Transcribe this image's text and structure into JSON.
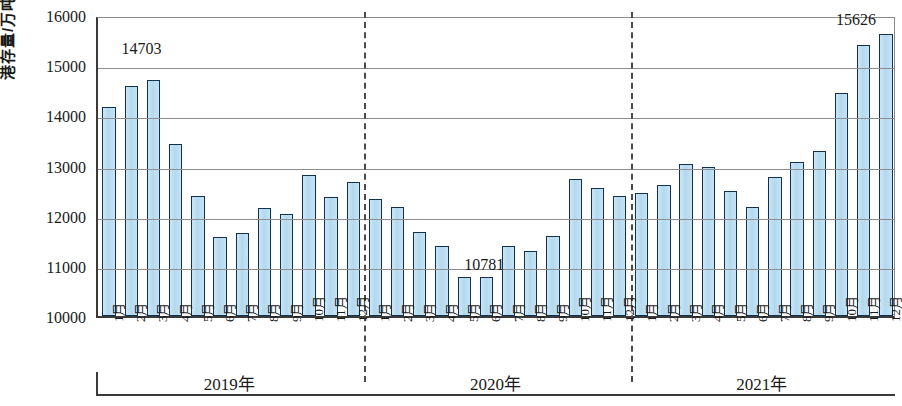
{
  "chart_data": {
    "type": "bar",
    "title": "",
    "xlabel": "",
    "ylabel": "港存量/万吨",
    "ylim": [
      10000,
      16000
    ],
    "ytick_values": [
      10000,
      11000,
      12000,
      13000,
      14000,
      15000,
      16000
    ],
    "ytick_labels": [
      "10000",
      "11000",
      "12000",
      "13000",
      "14000",
      "15000",
      "16000"
    ],
    "grid": true,
    "legend": "none",
    "groups": [
      {
        "label": "2019年",
        "categories": [
          "1月",
          "2月",
          "3月",
          "4月",
          "5月",
          "6月",
          "7月",
          "8月",
          "9月",
          "10月",
          "11月",
          "12月"
        ],
        "values": [
          14160,
          14590,
          14703,
          13430,
          12400,
          11580,
          11650,
          12150,
          12040,
          12820,
          12380,
          12670
        ]
      },
      {
        "label": "2020年",
        "categories": [
          "1月",
          "2月",
          "3月",
          "4月",
          "5月",
          "6月",
          "7月",
          "8月",
          "9月",
          "10月",
          "11月",
          "12月"
        ],
        "values": [
          12330,
          12180,
          11680,
          11400,
          10781,
          10781,
          11390,
          11290,
          11590,
          12740,
          12560,
          12400
        ]
      },
      {
        "label": "2021年",
        "categories": [
          "1月",
          "2月",
          "3月",
          "4月",
          "5月",
          "6月",
          "7月",
          "8月",
          "9月",
          "10月",
          "11月",
          "12月"
        ],
        "values": [
          12460,
          12620,
          13030,
          12980,
          12500,
          12170,
          12780,
          13080,
          13280,
          14450,
          15410,
          15626
        ]
      }
    ],
    "annotations": [
      {
        "text": "14703",
        "value": 14703,
        "group": "2019年",
        "category": "3月"
      },
      {
        "text": "10781",
        "value": 10781,
        "group": "2020年",
        "category": "5月"
      },
      {
        "text": "15626",
        "value": 15626,
        "group": "2021年",
        "category": "12月"
      }
    ],
    "colors": {
      "bar_fill": "#b9dcf0",
      "bar_border": "#12314d",
      "gridline": "#8d8d8d",
      "axis": "#3a3a3a",
      "divider": "#4a4a4a",
      "text": "#1a1a1a"
    }
  }
}
